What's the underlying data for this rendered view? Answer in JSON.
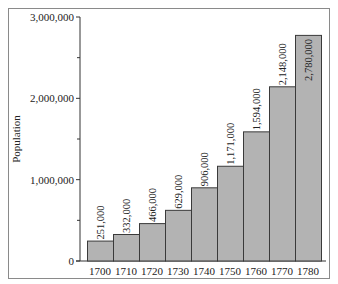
{
  "chart_data": {
    "type": "bar",
    "title": "",
    "xlabel": "",
    "ylabel": "Population",
    "categories": [
      "1700",
      "1710",
      "1720",
      "1730",
      "1740",
      "1750",
      "1760",
      "1770",
      "1780"
    ],
    "values": [
      251000,
      332000,
      466000,
      629000,
      906000,
      1171000,
      1594000,
      2148000,
      2780000
    ],
    "value_labels": [
      "251,000",
      "332,000",
      "466,000",
      "629,000",
      "906,000",
      "1,171,000",
      "1,594,000",
      "2,148,000",
      "2,780,000"
    ],
    "ylim": [
      0,
      3000000
    ],
    "y_ticks": [
      0,
      1000000,
      2000000,
      3000000
    ],
    "y_tick_labels": [
      "0",
      "1,000,000",
      "2,000,000",
      "3,000,000"
    ],
    "y_minor_ticks": [
      500000,
      1500000,
      2500000
    ],
    "grid": false,
    "legend": null,
    "colors": {
      "bar_fill": "#b3b3b3",
      "bar_stroke": "#3a3a3a",
      "axis": "#333333",
      "frame": "#8a8a8a"
    }
  }
}
